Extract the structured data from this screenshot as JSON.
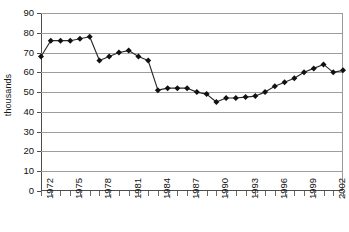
{
  "chart_data": {
    "type": "line",
    "title": "",
    "xlabel": "",
    "ylabel": "thousands",
    "ylim": [
      0,
      90
    ],
    "ytick_step": 10,
    "yticks": [
      0,
      10,
      20,
      30,
      40,
      50,
      60,
      70,
      80,
      90
    ],
    "ytick_labels": [
      "0",
      "10",
      "20",
      "30",
      "40",
      "50",
      "60",
      "70",
      "80",
      "90"
    ],
    "xlim": [
      1972,
      2003
    ],
    "xtick_label_step": 3,
    "grid": true,
    "legend": false,
    "marker": "diamond",
    "marker_color": "#111111",
    "line_color": "#2b2b2b",
    "x": [
      1972,
      1973,
      1974,
      1975,
      1976,
      1977,
      1978,
      1979,
      1980,
      1981,
      1982,
      1983,
      1984,
      1985,
      1986,
      1987,
      1988,
      1989,
      1990,
      1991,
      1992,
      1993,
      1994,
      1995,
      1996,
      1997,
      1998,
      1999,
      2000,
      2001,
      2002,
      2003
    ],
    "categories": [
      "1972",
      "1973",
      "1974",
      "1975",
      "1976",
      "1977",
      "1978",
      "1979",
      "1980",
      "1981",
      "1982",
      "1983",
      "1984",
      "1985",
      "1986",
      "1987",
      "1988",
      "1989",
      "1990",
      "1991",
      "1992",
      "1993",
      "1994",
      "1995",
      "1996",
      "1997",
      "1998",
      "1999",
      "2000",
      "2001",
      "2002",
      "2003"
    ],
    "xtick_labels_shown": [
      "1972",
      "1975",
      "1978",
      "1981",
      "1984",
      "1987",
      "1990",
      "1993",
      "1996",
      "1999",
      "2002"
    ],
    "values": [
      68,
      76,
      76,
      76,
      77,
      78,
      66,
      68,
      70,
      71,
      68,
      66,
      51,
      52,
      52,
      52,
      50,
      49,
      45,
      47,
      47,
      47.5,
      48,
      50,
      53,
      55,
      57,
      60,
      62,
      64,
      60,
      61
    ],
    "series": [
      {
        "name": "thousands",
        "values": [
          68,
          76,
          76,
          76,
          77,
          78,
          66,
          68,
          70,
          71,
          68,
          66,
          51,
          52,
          52,
          52,
          50,
          49,
          45,
          47,
          47,
          47.5,
          48,
          50,
          53,
          55,
          57,
          60,
          62,
          64,
          60,
          61
        ]
      }
    ]
  }
}
